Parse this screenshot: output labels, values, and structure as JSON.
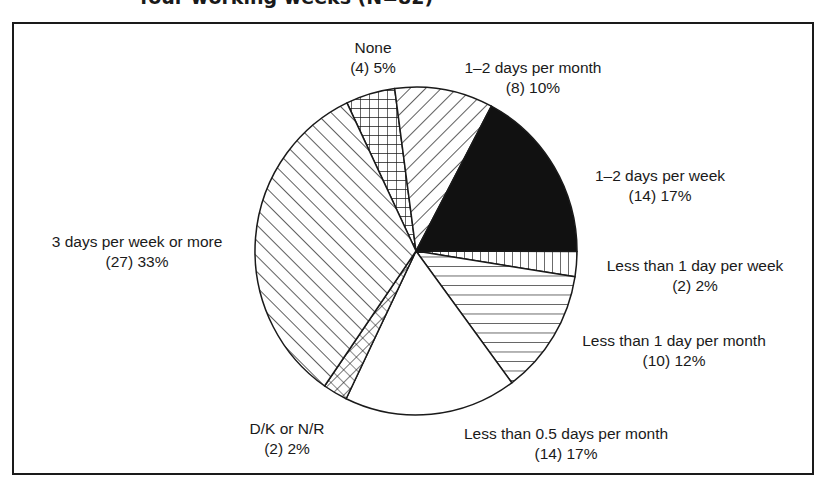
{
  "title": "four working weeks (N=82)",
  "chart_data": {
    "type": "pie",
    "title": "four working weeks (N=82)",
    "start_angle_deg": -25.4,
    "direction": "clockwise",
    "slices": [
      {
        "label": "None",
        "count": 4,
        "percent": 5,
        "pattern": "grid",
        "value_text": "(4) 5%"
      },
      {
        "label": "1–2 days per month",
        "count": 8,
        "percent": 10,
        "pattern": "diag-up",
        "value_text": "(8) 10%"
      },
      {
        "label": "1–2 days per week",
        "count": 14,
        "percent": 17,
        "pattern": "solid-black",
        "value_text": "(14) 17%"
      },
      {
        "label": "Less than 1 day per week",
        "count": 2,
        "percent": 2,
        "pattern": "vertical",
        "value_text": "(2) 2%"
      },
      {
        "label": "Less than 1 day per month",
        "count": 10,
        "percent": 12,
        "pattern": "horizontal",
        "value_text": "(10) 12%"
      },
      {
        "label": "Less than 0.5 days per month",
        "count": 14,
        "percent": 17,
        "pattern": "white",
        "value_text": "(14) 17%"
      },
      {
        "label": "D/K or N/R",
        "count": 2,
        "percent": 2,
        "pattern": "diag-grid",
        "value_text": "(2) 2%"
      },
      {
        "label": "3 days per week or more",
        "count": 27,
        "percent": 33,
        "pattern": "diag-down",
        "value_text": "(27) 33%"
      }
    ],
    "colors": {
      "ink": "#1a1a1a",
      "background": "#ffffff"
    }
  }
}
